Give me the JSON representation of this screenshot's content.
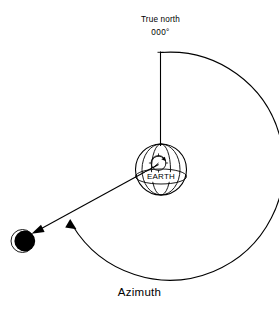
{
  "figure": {
    "caption": "Azimuth",
    "north_label_line1": "True north",
    "north_label_line2": "000°",
    "earth_label": "EARTH",
    "ink_color": "#000000",
    "background_color": "#ffffff"
  },
  "elements": {
    "north_reference_line": "vertical line from true north marker down to observer on Earth",
    "azimuth_arc": "clockwise arc from true north around to the line of sight",
    "line_of_sight": "straight line from observer on Earth to celestial body",
    "celestial_body": "dark filled sphere at lower left",
    "earth_globe": "sphere with meridians and equator labelled EARTH",
    "observer_compass": "small circle with index marks and rotation arrow on Earth"
  }
}
